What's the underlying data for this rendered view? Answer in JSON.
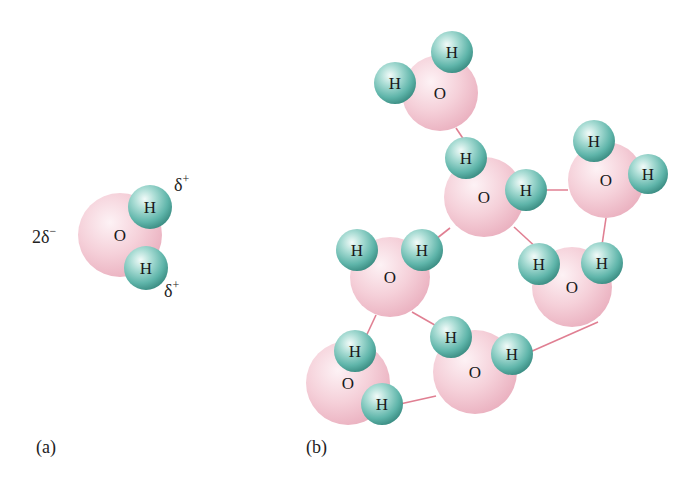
{
  "colors": {
    "oxygen": "#f2c4cf",
    "oxygen_light": "#fbe8ed",
    "hydrogen": "#5fb5aa",
    "hydrogen_light": "#e6f7f4",
    "hydrogen_dark": "#3d8f85",
    "bond": "#e07f92",
    "text": "#1a1a1a"
  },
  "atom_labels": {
    "oxygen": "O",
    "hydrogen": "H"
  },
  "panel_a": {
    "label": "(a)",
    "charges": {
      "oxygen": "2δ",
      "oxygen_sign": "−",
      "hydrogen": "δ",
      "hydrogen_sign": "+"
    },
    "molecule": {
      "O": [
        120,
        235,
        42
      ],
      "H": [
        [
          150,
          207,
          22
        ],
        [
          146,
          268,
          22
        ]
      ]
    }
  },
  "panel_b": {
    "label": "(b)",
    "molecules": [
      {
        "O": [
          440,
          93,
          38
        ],
        "H": [
          [
            452,
            52,
            21
          ],
          [
            395,
            83,
            21
          ]
        ]
      },
      {
        "O": [
          484,
          197,
          40
        ],
        "H": [
          [
            466,
            158,
            21
          ],
          [
            526,
            190,
            21
          ]
        ]
      },
      {
        "O": [
          606,
          180,
          38
        ],
        "H": [
          [
            594,
            141,
            21
          ],
          [
            648,
            174,
            20
          ]
        ]
      },
      {
        "O": [
          390,
          277,
          40
        ],
        "H": [
          [
            357,
            250,
            21
          ],
          [
            422,
            250,
            21
          ]
        ]
      },
      {
        "O": [
          572,
          287,
          40
        ],
        "H": [
          [
            539,
            264,
            21
          ],
          [
            602,
            263,
            21
          ]
        ]
      },
      {
        "O": [
          348,
          383,
          42
        ],
        "H": [
          [
            355,
            351,
            21
          ],
          [
            382,
            404,
            21
          ]
        ]
      },
      {
        "O": [
          475,
          372,
          42
        ],
        "H": [
          [
            451,
            337,
            21
          ],
          [
            512,
            354,
            21
          ]
        ]
      }
    ],
    "hydrogen_bonds": [
      [
        456,
        128,
        464,
        140
      ],
      [
        526,
        190,
        568,
        190
      ],
      [
        606,
        218,
        602,
        245
      ],
      [
        450,
        228,
        422,
        250
      ],
      [
        514,
        227,
        539,
        250
      ],
      [
        376,
        315,
        362,
        345
      ],
      [
        412,
        312,
        440,
        328
      ],
      [
        598,
        322,
        530,
        352
      ],
      [
        400,
        404,
        436,
        396
      ]
    ]
  }
}
